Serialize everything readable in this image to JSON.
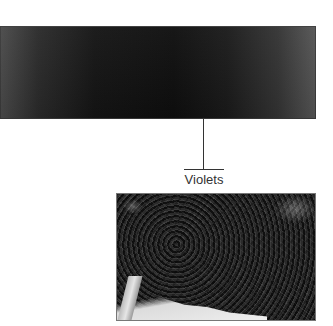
{
  "figure": {
    "banner": {
      "description": "dark gradient banner image",
      "color_center": "#0e0e0e",
      "color_edge_left": "#4a4a4a",
      "color_edge_right": "#555555"
    },
    "callout": {
      "label": "Violets"
    },
    "photo": {
      "description": "photo of dense violet foliage"
    }
  }
}
